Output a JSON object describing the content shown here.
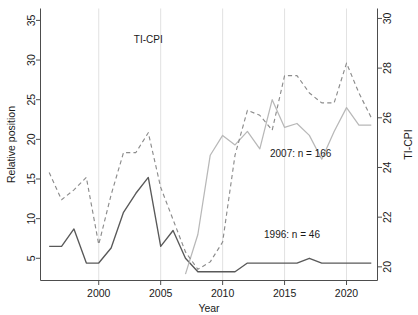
{
  "chart_data": {
    "type": "line",
    "title": "",
    "xlabel": "Year",
    "ylabel": "Relative position",
    "y2label": "TI-CPI",
    "xlim": [
      1995.3,
      2022.5
    ],
    "ylim": [
      2.2,
      36.5
    ],
    "y2lim": [
      19.45,
      30.4
    ],
    "grid": "vertical gridlines at x tick positions",
    "legend": "none; in-plot text annotations",
    "xticks": [
      2000,
      2005,
      2010,
      2015,
      2020
    ],
    "yticks": [
      5,
      10,
      15,
      20,
      25,
      30,
      35
    ],
    "y2ticks": [
      20,
      22,
      24,
      26,
      28,
      30
    ],
    "annotations": [
      {
        "text": "TI-CPI",
        "x": 2004.0,
        "y": 29.0
      },
      {
        "text": "2007: n = 166",
        "x": 2016.3,
        "y": 17.8
      },
      {
        "text": "1996: n = 46",
        "x": 2015.6,
        "y": 7.6
      }
    ],
    "series": [
      {
        "name": "1996: n = 46",
        "label": "1996: n = 46",
        "axis": "left",
        "style": "solid",
        "color": "#595959",
        "x": [
          1996,
          1997,
          1998,
          1999,
          2000,
          2001,
          2002,
          2003,
          2004,
          2005,
          2006,
          2007,
          2008,
          2009,
          2010,
          2011,
          2012,
          2013,
          2014,
          2015,
          2016,
          2017,
          2018,
          2019,
          2020,
          2021,
          2022
        ],
        "values": [
          6.5,
          6.5,
          8.7,
          4.4,
          4.4,
          6.3,
          10.8,
          13.2,
          15.2,
          6.5,
          8.5,
          5.0,
          3.3,
          3.3,
          3.3,
          3.3,
          4.4,
          4.4,
          4.4,
          4.4,
          4.4,
          5.0,
          4.4,
          4.4,
          4.4,
          4.4,
          4.4
        ]
      },
      {
        "name": "2007: n = 166",
        "label": "2007: n = 166",
        "axis": "left",
        "style": "solid",
        "color": "#b8b8b8",
        "x": [
          2007,
          2008,
          2009,
          2010,
          2011,
          2012,
          2013,
          2014,
          2015,
          2016,
          2017,
          2018,
          2019,
          2020,
          2021,
          2022
        ],
        "values": [
          3.0,
          8.0,
          18.0,
          20.5,
          19.3,
          21.0,
          18.8,
          25.0,
          21.5,
          22.0,
          20.5,
          17.5,
          21.0,
          24.0,
          21.8,
          21.8
        ]
      },
      {
        "name": "TI-CPI",
        "label": "TI-CPI",
        "axis": "right",
        "style": "dashed",
        "color": "#8c8c8c",
        "x": [
          1996,
          1997,
          1998,
          1999,
          2000,
          2001,
          2002,
          2003,
          2004,
          2005,
          2006,
          2007,
          2008,
          2009,
          2010,
          2011,
          2012,
          2013,
          2014,
          2015,
          2016,
          2017,
          2018,
          2019,
          2020,
          2021,
          2022
        ],
        "values": [
          23.8,
          22.7,
          23.1,
          23.6,
          20.9,
          22.9,
          24.6,
          24.6,
          25.4,
          23.2,
          21.9,
          20.6,
          19.9,
          20.2,
          21.0,
          24.5,
          26.3,
          26.1,
          25.5,
          27.7,
          27.7,
          27.0,
          26.6,
          26.6,
          28.2,
          27.0,
          26.0
        ]
      }
    ]
  },
  "axes": {
    "left_title": "Relative position",
    "right_title": "TI-CPI",
    "x_title": "Year",
    "x_tick_labels": [
      "2000",
      "2005",
      "2010",
      "2015",
      "2020"
    ],
    "y_tick_labels": [
      "5",
      "10",
      "15",
      "20",
      "25",
      "30",
      "35"
    ],
    "y2_tick_labels": [
      "20",
      "22",
      "24",
      "26",
      "28",
      "30"
    ]
  },
  "annotations": {
    "ticpi": "TI-CPI",
    "cohort_2007": "2007: n = 166",
    "cohort_1996": "1996: n = 46"
  },
  "colors": {
    "dark_line": "#595959",
    "light_line": "#b8b8b8",
    "dashed_line": "#8c8c8c",
    "axis": "#4d4d4d",
    "grid": "#d9d9d9",
    "background": "#ffffff"
  }
}
